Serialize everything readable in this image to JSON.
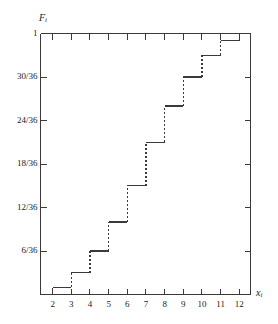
{
  "chart_data": {
    "type": "line",
    "title": "",
    "subtitle": "",
    "xlabel": "x_i",
    "ylabel": "F_i",
    "xlabel_base": "x",
    "xlabel_sub": "i",
    "ylabel_base": "F",
    "ylabel_sub": "i",
    "x": [
      2,
      3,
      4,
      5,
      6,
      7,
      8,
      9,
      10,
      11,
      12
    ],
    "values": [
      0.027777778,
      0.083333333,
      0.166666667,
      0.277777778,
      0.416666667,
      0.583333333,
      0.722222222,
      0.833333333,
      0.916666667,
      0.972222222,
      1.0
    ],
    "value_labels": [
      "1/36",
      "3/36",
      "6/36",
      "10/36",
      "15/36",
      "21/36",
      "26/36",
      "30/36",
      "33/36",
      "35/36",
      "36/36"
    ],
    "xlim": [
      1.35,
      12.6
    ],
    "ylim": [
      0,
      1
    ],
    "grid": false,
    "legend": "none",
    "step_style": "post",
    "riser_style": "dashed",
    "tread_style": "solid",
    "line_color": "#3a3a3a",
    "axis_color": "#3a3a3a",
    "background": "#ffffff",
    "xticks": [
      {
        "value": 2,
        "label": "2"
      },
      {
        "value": 3,
        "label": "3"
      },
      {
        "value": 4,
        "label": "4"
      },
      {
        "value": 5,
        "label": "5"
      },
      {
        "value": 6,
        "label": "6"
      },
      {
        "value": 7,
        "label": "7"
      },
      {
        "value": 8,
        "label": "8"
      },
      {
        "value": 9,
        "label": "9"
      },
      {
        "value": 10,
        "label": "10"
      },
      {
        "value": 11,
        "label": "11"
      },
      {
        "value": 12,
        "label": "12"
      }
    ],
    "yticks": [
      {
        "value": 1.0,
        "label": "1"
      },
      {
        "value": 0.833333333,
        "label": "30/36"
      },
      {
        "value": 0.666666667,
        "label": "24/36"
      },
      {
        "value": 0.5,
        "label": "18/36"
      },
      {
        "value": 0.333333333,
        "label": "12/36"
      },
      {
        "value": 0.166666667,
        "label": "6/36"
      }
    ],
    "top_axis_ticks": [
      2,
      3,
      4,
      5,
      6,
      7,
      8,
      9,
      10,
      11,
      12
    ],
    "right_axis_ticks": [
      0.833333333,
      0.666666667,
      0.5,
      0.333333333,
      0.166666667
    ]
  }
}
